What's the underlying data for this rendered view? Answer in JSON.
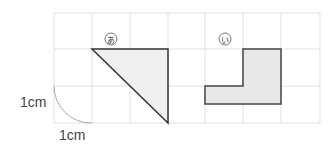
{
  "diagram": {
    "grid": {
      "cols": 7,
      "rows": 3,
      "cell_unit": "1cm"
    },
    "shapes": [
      {
        "label": "あ",
        "type": "right-triangle",
        "fill": "#f0f0f0"
      },
      {
        "label": "い",
        "type": "L-shape",
        "fill": "#eaeaea"
      }
    ],
    "unit_labels": {
      "vertical": "1cm",
      "horizontal": "1cm"
    },
    "colors": {
      "grid": "#dedede",
      "outline": "#333333"
    }
  }
}
